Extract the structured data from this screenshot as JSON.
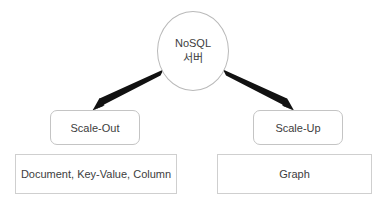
{
  "diagram": {
    "background_color": "#ffffff",
    "text_color": "#3d3d3d",
    "edge_color": "#111111",
    "node_border_color": "#c4c4c4",
    "root": {
      "label_line1": "NoSQL",
      "label_line2": "서버"
    },
    "branches": [
      {
        "id": "scale-out",
        "label": "Scale-Out",
        "leaf": "Document, Key-Value, Column"
      },
      {
        "id": "scale-up",
        "label": "Scale-Up",
        "leaf": "Graph"
      }
    ]
  }
}
